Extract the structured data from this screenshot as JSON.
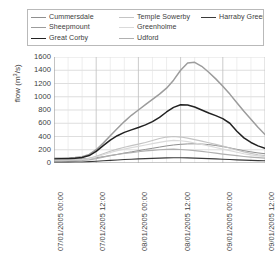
{
  "chart_data": {
    "type": "line",
    "title": "",
    "subtitle": "",
    "xlabel": "",
    "ylabel": "flow (m3/s)",
    "ylabel_parts": {
      "prefix": "flow (m",
      "sup": "3",
      "suffix": "/s)"
    },
    "ylim": [
      0,
      1600
    ],
    "ytick_step": 200,
    "ytick_labels": [
      "1600",
      "1400",
      "1200",
      "1000",
      "800",
      "600",
      "400",
      "200",
      "0"
    ],
    "ytick_values": [
      1600,
      1400,
      1200,
      1000,
      800,
      600,
      400,
      200,
      0
    ],
    "grid": true,
    "grid_color": "#d0d0d0",
    "axis_color": "#9a9a9a",
    "background": "#ffffff",
    "legend_position": "top",
    "legend_columns": 3,
    "xlim_hours": [
      0,
      60
    ],
    "xtick_labels": [
      "07/01/2005 00:00",
      "07/01/2005 12:00",
      "08/01/2005 00:00",
      "08/01/2005 12:00",
      "09/01/2005 00:00",
      "09/01/2005 12:00"
    ],
    "xtick_hours": [
      0,
      12,
      24,
      36,
      48,
      60
    ],
    "x_hours": [
      0,
      2,
      4,
      6,
      8,
      10,
      12,
      14,
      16,
      18,
      20,
      22,
      24,
      26,
      28,
      30,
      32,
      34,
      36,
      38,
      40,
      42,
      44,
      46,
      48,
      50,
      52,
      54,
      56,
      58,
      60
    ],
    "series": [
      {
        "name": "Cummersdale",
        "color": "#8f8f8f",
        "width": 1.0,
        "values": [
          55,
          56,
          58,
          60,
          64,
          70,
          80,
          95,
          112,
          130,
          150,
          168,
          186,
          205,
          222,
          240,
          258,
          272,
          282,
          288,
          290,
          286,
          278,
          264,
          248,
          228,
          206,
          186,
          168,
          152,
          140
        ]
      },
      {
        "name": "Sheepmount",
        "color": "#9c9c9c",
        "width": 1.5,
        "values": [
          70,
          72,
          76,
          82,
          96,
          130,
          200,
          300,
          410,
          520,
          625,
          720,
          800,
          880,
          960,
          1040,
          1130,
          1250,
          1400,
          1510,
          1520,
          1460,
          1370,
          1270,
          1160,
          1040,
          910,
          780,
          660,
          540,
          430
        ]
      },
      {
        "name": "Great Corby",
        "color": "#222222",
        "width": 1.5,
        "values": [
          62,
          63,
          66,
          70,
          82,
          112,
          175,
          262,
          345,
          412,
          462,
          500,
          535,
          575,
          625,
          690,
          770,
          840,
          878,
          875,
          845,
          800,
          755,
          715,
          670,
          600,
          480,
          380,
          310,
          258,
          222
        ]
      },
      {
        "name": "Temple Sowerby",
        "color": "#c4c4c4",
        "width": 1.2,
        "values": [
          42,
          43,
          45,
          48,
          55,
          70,
          100,
          140,
          178,
          210,
          238,
          262,
          285,
          310,
          340,
          370,
          392,
          400,
          392,
          375,
          352,
          330,
          306,
          282,
          255,
          226,
          196,
          168,
          144,
          124,
          110
        ]
      },
      {
        "name": "Greenholme",
        "color": "#dadada",
        "width": 1.2,
        "values": [
          35,
          36,
          38,
          41,
          48,
          62,
          90,
          125,
          158,
          186,
          210,
          232,
          252,
          272,
          292,
          312,
          330,
          340,
          336,
          322,
          302,
          280,
          258,
          234,
          210,
          186,
          162,
          140,
          122,
          108,
          96
        ]
      },
      {
        "name": "Udford",
        "color": "#b0b0b0",
        "width": 1.2,
        "values": [
          28,
          29,
          30,
          33,
          38,
          48,
          66,
          88,
          110,
          128,
          145,
          158,
          170,
          182,
          192,
          200,
          206,
          208,
          204,
          196,
          186,
          174,
          162,
          148,
          135,
          122,
          110,
          98,
          88,
          80,
          74
        ]
      },
      {
        "name": "Harraby Green",
        "color": "#3a3a3a",
        "width": 1.1,
        "values": [
          12,
          12,
          13,
          14,
          16,
          20,
          26,
          33,
          40,
          46,
          52,
          57,
          62,
          66,
          70,
          74,
          77,
          79,
          79,
          77,
          74,
          70,
          66,
          62,
          57,
          52,
          47,
          43,
          39,
          36,
          33
        ]
      }
    ]
  },
  "legend": {
    "entries": [
      {
        "label": "Cummersdale",
        "color": "#8f8f8f",
        "col": 1,
        "row": 1
      },
      {
        "label": "Temple Sowerby",
        "color": "#c4c4c4",
        "col": 2,
        "row": 1
      },
      {
        "label": "Harraby Green",
        "color": "#3a3a3a",
        "col": 3,
        "row": 1
      },
      {
        "label": "Sheepmount",
        "color": "#9c9c9c",
        "col": 1,
        "row": 2
      },
      {
        "label": "Greenholme",
        "color": "#dadada",
        "col": 2,
        "row": 2
      },
      {
        "label": "Great Corby",
        "color": "#222222",
        "col": 1,
        "row": 3
      },
      {
        "label": "Udford",
        "color": "#b0b0b0",
        "col": 2,
        "row": 3
      }
    ]
  }
}
